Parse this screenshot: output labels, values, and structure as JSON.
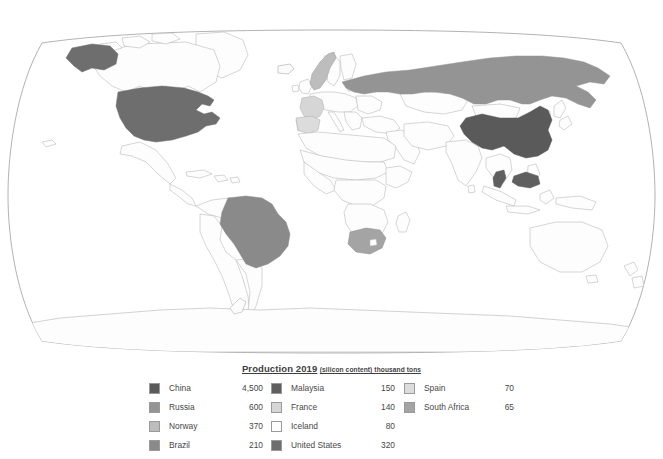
{
  "map": {
    "title": "World production map",
    "projection": "robinson",
    "frame_color": "#9e9e9e",
    "ocean_color": "#ffffff",
    "default_country_fill": "#fdfdfd",
    "country_border_color": "#b4b4b4",
    "highlighted_countries": [
      {
        "name": "China",
        "fill": "#5a5a5a"
      },
      {
        "name": "Russia",
        "fill": "#949494"
      },
      {
        "name": "Norway",
        "fill": "#bdbdbd"
      },
      {
        "name": "Brazil",
        "fill": "#8a8a8a"
      },
      {
        "name": "Malaysia",
        "fill": "#5f5f5f"
      },
      {
        "name": "France",
        "fill": "#d6d6d6"
      },
      {
        "name": "Iceland",
        "fill": "#fbfbfb"
      },
      {
        "name": "United States",
        "fill": "#6e6e6e"
      },
      {
        "name": "Spain",
        "fill": "#dcdcdc"
      },
      {
        "name": "South Africa",
        "fill": "#a4a4a4"
      }
    ]
  },
  "legend": {
    "title_main": "Production 2019",
    "title_sub": "(silicon content) thousand tons",
    "columns": [
      {
        "id": "column-1",
        "rows": [
          {
            "country": "China",
            "value": "4,500",
            "color": "#5a5a5a"
          },
          {
            "country": "Russia",
            "value": "600",
            "color": "#949494"
          },
          {
            "country": "Norway",
            "value": "370",
            "color": "#bdbdbd"
          },
          {
            "country": "Brazil",
            "value": "210",
            "color": "#8a8a8a"
          }
        ]
      },
      {
        "id": "column-2",
        "rows": [
          {
            "country": "Malaysia",
            "value": "150",
            "color": "#5f5f5f"
          },
          {
            "country": "France",
            "value": "140",
            "color": "#d6d6d6"
          },
          {
            "country": "Iceland",
            "value": "80",
            "color": "#fdfdfd"
          },
          {
            "country": "United States",
            "value": "320",
            "color": "#6e6e6e"
          }
        ]
      },
      {
        "id": "column-3",
        "rows": [
          {
            "country": "Spain",
            "value": "70",
            "color": "#dcdcdc"
          },
          {
            "country": "South Africa",
            "value": "65",
            "color": "#a4a4a4"
          }
        ]
      }
    ]
  }
}
